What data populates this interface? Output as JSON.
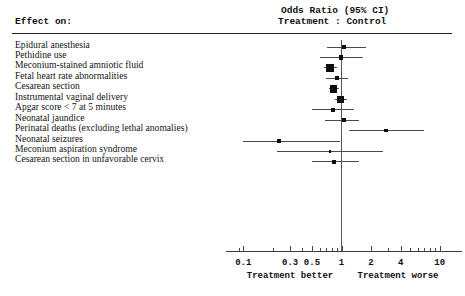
{
  "header": {
    "effect_label": "Effect on:",
    "or_title": "Odds Ratio (95% CI)",
    "or_subtitle": "Treatment : Control"
  },
  "axis": {
    "tick_labels": [
      "0.1",
      "0.3",
      "0.5",
      "1",
      "2",
      "4",
      "10"
    ],
    "caption_left": "Treatment better",
    "caption_right": "Treatment worse"
  },
  "chart_data": {
    "type": "forest",
    "title": "Odds Ratio (95% CI)",
    "subtitle": "Treatment : Control",
    "xlabel": "Odds Ratio",
    "ylabel": "Effect on:",
    "xscale": "log",
    "xlim": [
      0.08,
      12
    ],
    "xticks": [
      0.1,
      0.3,
      0.5,
      1,
      2,
      4,
      10
    ],
    "xticklabels": [
      "0.1",
      "0.3",
      "0.5",
      "1",
      "2",
      "4",
      "10"
    ],
    "reference_line": 1,
    "grid": false,
    "legend": "none",
    "annotations": [
      "Treatment better",
      "Treatment worse"
    ],
    "categories": [
      "Epidural anesthesia",
      "Pethidine use",
      "Meconium-stained amniotic fluid",
      "Fetal heart rate abnormalities",
      "Cesarean section",
      "Instrumental vaginal delivery",
      "Apgar score < 7 at 5 minutes",
      "Neonatal jaundice",
      "Perinatal deaths (excluding lethal anomalies)",
      "Neonatal seizures",
      "Meconium aspiration syndrome",
      "Cesarean section in unfavorable cervix"
    ],
    "points": [
      {
        "label": "Epidural anesthesia",
        "or": 1.06,
        "ci_low": 0.72,
        "ci_high": 1.78,
        "weight": "small"
      },
      {
        "label": "Pethidine use",
        "or": 0.99,
        "ci_low": 0.6,
        "ci_high": 1.64,
        "weight": "small"
      },
      {
        "label": "Meconium-stained amniotic fluid",
        "or": 0.77,
        "ci_low": 0.66,
        "ci_high": 0.9,
        "weight": "large"
      },
      {
        "label": "Fetal heart rate abnormalities",
        "or": 0.9,
        "ci_low": 0.7,
        "ci_high": 1.16,
        "weight": "small"
      },
      {
        "label": "Cesarean section",
        "or": 0.83,
        "ci_low": 0.74,
        "ci_high": 0.94,
        "weight": "large"
      },
      {
        "label": "Instrumental vaginal delivery",
        "or": 0.98,
        "ci_low": 0.86,
        "ci_high": 1.13,
        "weight": "large"
      },
      {
        "label": "Apgar score < 7 at 5 minutes",
        "or": 0.82,
        "ci_low": 0.5,
        "ci_high": 1.35,
        "weight": "small"
      },
      {
        "label": "Perinatal deaths (excluding lethal anomalies)",
        "or": 2.84,
        "ci_low": 1.19,
        "ci_high": 6.92,
        "weight": "small"
      },
      {
        "label": "Neonatal seizures",
        "or": 0.23,
        "ci_low": 0.1,
        "ci_high": 0.96,
        "weight": "small"
      },
      {
        "label": "Meconium aspiration syndrome",
        "or": 0.76,
        "ci_low": 0.22,
        "ci_high": 2.62,
        "weight": "tiny"
      },
      {
        "label": "Cesarean section in unfavorable cervix",
        "or": 0.83,
        "ci_low": 0.5,
        "ci_high": 1.49,
        "weight": "small"
      },
      {
        "label": "Neonatal jaundice",
        "or": 1.06,
        "ci_low": 0.68,
        "ci_high": 1.49,
        "weight": "small"
      }
    ],
    "rows": [
      {
        "label": "Epidural anesthesia",
        "or": 1.06,
        "ci_low": 0.72,
        "ci_high": 1.78,
        "marker": 4.5
      },
      {
        "label": "Pethidine use",
        "or": 0.99,
        "ci_low": 0.6,
        "ci_high": 1.64,
        "marker": 4.5
      },
      {
        "label": "Meconium-stained amniotic fluid",
        "or": 0.77,
        "ci_low": 0.66,
        "ci_high": 0.9,
        "marker": 8.0
      },
      {
        "label": "Fetal heart rate abnormalities",
        "or": 0.9,
        "ci_low": 0.7,
        "ci_high": 1.16,
        "marker": 4.0
      },
      {
        "label": "Cesarean section",
        "or": 0.83,
        "ci_low": 0.74,
        "ci_high": 0.94,
        "marker": 7.5
      },
      {
        "label": "Instrumental vaginal delivery",
        "or": 0.98,
        "ci_low": 0.86,
        "ci_high": 1.13,
        "marker": 6.5
      },
      {
        "label": "Apgar score < 7 at 5 minutes",
        "or": 0.82,
        "ci_low": 0.5,
        "ci_high": 1.35,
        "marker": 4.0
      },
      {
        "label": "Neonatal jaundice",
        "or": 1.06,
        "ci_low": 0.68,
        "ci_high": 1.49,
        "marker": 4.0
      },
      {
        "label": "Perinatal deaths (excluding lethal anomalies)",
        "or": 2.84,
        "ci_low": 1.19,
        "ci_high": 6.92,
        "marker": 3.5
      },
      {
        "label": "Neonatal seizures",
        "or": 0.23,
        "ci_low": 0.1,
        "ci_high": 0.96,
        "marker": 4.0
      },
      {
        "label": "Meconium aspiration syndrome",
        "or": 0.76,
        "ci_low": 0.22,
        "ci_high": 2.62,
        "marker": 2.5
      },
      {
        "label": "Cesarean section in unfavorable cervix",
        "or": 0.83,
        "ci_low": 0.5,
        "ci_high": 1.49,
        "marker": 4.0
      }
    ]
  }
}
